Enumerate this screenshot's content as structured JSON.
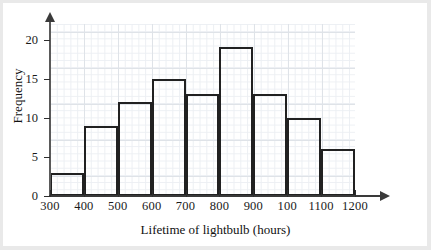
{
  "chart_data": {
    "type": "bar",
    "title": "",
    "subtitle": "",
    "xlabel": "Lifetime of lightbulb (hours)",
    "ylabel": "Frequency",
    "categories": [
      "300-400",
      "400-500",
      "500-600",
      "600-700",
      "700-800",
      "800-900",
      "900-1000",
      "1000-1100",
      "1100-1200"
    ],
    "values": [
      3,
      9,
      12,
      15,
      13,
      19,
      13,
      10,
      6
    ],
    "bin_edges": [
      300,
      400,
      500,
      600,
      700,
      800,
      900,
      1000,
      1100,
      1200
    ],
    "xticks": [
      "300",
      "400",
      "500",
      "600",
      "700",
      "800",
      "900",
      "100",
      "1100",
      "1200"
    ],
    "xtick_values": [
      300,
      400,
      500,
      600,
      700,
      800,
      900,
      1000,
      1100,
      1200
    ],
    "yticks": [
      "0",
      "5",
      "10",
      "15",
      "20"
    ],
    "ytick_values": [
      0,
      5,
      10,
      15,
      20
    ],
    "xlim": [
      300,
      1200
    ],
    "ylim": [
      0,
      22
    ],
    "grid": true,
    "legend": "none",
    "bar_fill": "#ffffff",
    "bar_stroke": "#212121",
    "grid_color": "#dfe3e8",
    "axis_color": "#3a3a3a",
    "background": "#ffffff"
  }
}
